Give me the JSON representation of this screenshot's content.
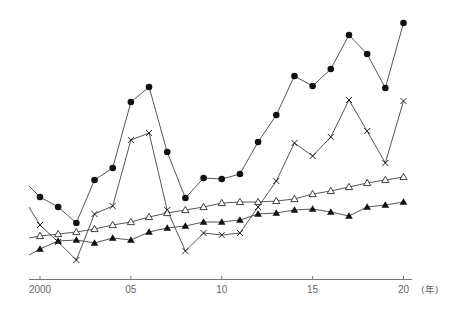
{
  "chart_data": {
    "type": "line",
    "title": "",
    "xlabel": "(年)",
    "ylabel": "",
    "x": [
      2000,
      2001,
      2002,
      2003,
      2004,
      2005,
      2006,
      2007,
      2008,
      2009,
      2010,
      2011,
      2012,
      2013,
      2014,
      2015,
      2016,
      2017,
      2018,
      2019,
      2020
    ],
    "x_tick_values": [
      2000,
      2005,
      2010,
      2015,
      2020
    ],
    "x_tick_labels": [
      "2000",
      "05",
      "10",
      "15",
      "20"
    ],
    "y_axis_visible": false,
    "y_units": "relative height above baseline (no y-axis shown)",
    "grid": false,
    "legend": "none",
    "series": [
      {
        "name": "series-filled-circle",
        "marker": "filled-circle",
        "lead_in": 94,
        "values": [
          83,
          73,
          57,
          100,
          112,
          178,
          193,
          128,
          82,
          102,
          101,
          106,
          138,
          165,
          204,
          194,
          211,
          245,
          226,
          192,
          257
        ]
      },
      {
        "name": "series-cross",
        "marker": "cross",
        "lead_in": 73,
        "values": [
          55,
          38,
          20,
          66,
          74,
          140,
          147,
          70,
          29,
          47,
          45,
          47,
          73,
          99,
          137,
          124,
          143,
          180,
          149,
          117,
          179
        ]
      },
      {
        "name": "series-open-triangle",
        "marker": "open-triangle",
        "lead_in": 42,
        "values": [
          44,
          46,
          48,
          51,
          55,
          58,
          63,
          67,
          70,
          73,
          77,
          78,
          78,
          79,
          81,
          86,
          89,
          93,
          97,
          100,
          103
        ]
      },
      {
        "name": "series-filled-triangle",
        "marker": "filled-triangle",
        "lead_in": 25,
        "values": [
          31,
          39,
          40,
          37,
          42,
          40,
          48,
          52,
          54,
          58,
          58,
          60,
          66,
          67,
          70,
          71,
          68,
          64,
          73,
          75,
          78
        ]
      }
    ]
  },
  "colors": {
    "background": "#ffffff",
    "line": "#444444",
    "marker": "#111111",
    "axis": "#777777",
    "text": "#666666"
  }
}
